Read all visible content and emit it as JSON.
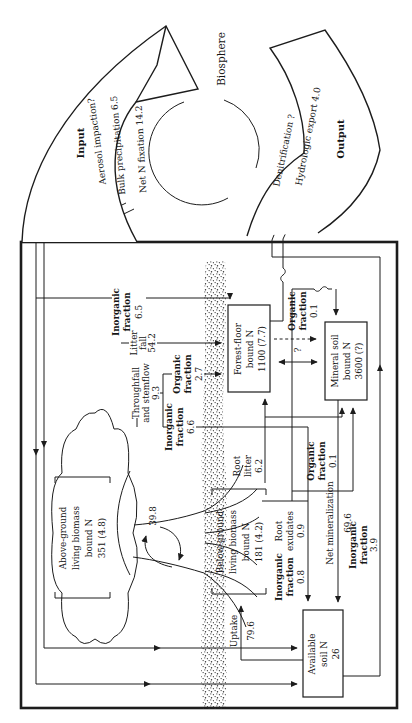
{
  "biosphere": {
    "label": "Biosphere",
    "input_title": "Input",
    "output_title": "Output",
    "input_flows": {
      "aerosol": "Aerosol impaction?",
      "precipitation": "Bulk precipitation 6.5",
      "fixation": "Net N fixation 14.2"
    },
    "output_flows": {
      "denitrification": "Denitrification ?",
      "hydrologic": "Hydrologic export 4.0"
    }
  },
  "compartments": {
    "above_ground": {
      "lines": [
        "Above-ground",
        "living biomass",
        "bound N",
        "351 (4.8)"
      ]
    },
    "below_ground": {
      "lines": [
        "Below-ground",
        "living biomass",
        "bound N",
        "181 (4.2)"
      ]
    },
    "forest_floor": {
      "lines": [
        "Forest-floor",
        "bound N",
        "1100 (7.7)"
      ]
    },
    "mineral_soil": {
      "lines": [
        "Mineral soil",
        "bound N",
        "3600 (?)"
      ]
    },
    "available_soil": {
      "lines": [
        "Available",
        "soil N",
        "26"
      ]
    }
  },
  "flows": {
    "input_inorganic": {
      "lines": [
        "Inorganic",
        "fraction",
        "6.5"
      ]
    },
    "litter_fall": {
      "lines": [
        "Litter",
        "fall",
        "54.2"
      ]
    },
    "throughfall": {
      "lines": [
        "Throughfall",
        "and stemflow",
        "9.3"
      ]
    },
    "throughfall_inorganic": {
      "lines": [
        "Inorganic",
        "fraction",
        "6.6"
      ]
    },
    "throughfall_organic": {
      "lines": [
        "Organic",
        "fraction",
        "2.7"
      ]
    },
    "root_litter": {
      "lines": [
        "Root",
        "litter",
        "6.2"
      ]
    },
    "root_exudates": {
      "lines": [
        "Root",
        "exudates",
        "0.9"
      ]
    },
    "exudates_inorganic": {
      "lines": [
        "Inorganic",
        "fraction",
        "0.8"
      ]
    },
    "exudates_organic": {
      "lines": [
        "Organic",
        "fraction",
        "0.1"
      ]
    },
    "export_organic": {
      "lines": [
        "Organic",
        "fraction",
        "0.1"
      ]
    },
    "export_inorganic": {
      "lines": [
        "Inorganic",
        "fraction",
        "3.9"
      ]
    },
    "net_mineralization": {
      "label": "Net mineralization",
      "value": "69.6"
    },
    "uptake": {
      "label": "Uptake",
      "value": "79.6"
    },
    "translocation": {
      "value": "39.8"
    },
    "unknown_transfer": {
      "value": "?"
    }
  }
}
